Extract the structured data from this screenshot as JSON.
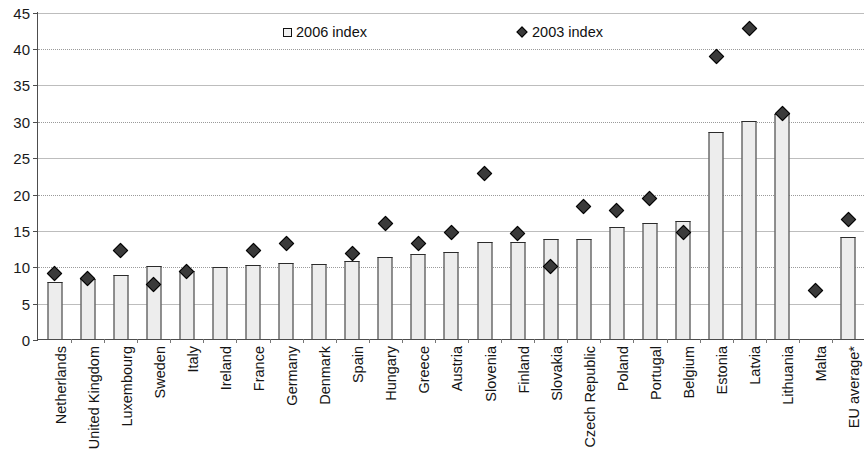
{
  "chart_data": {
    "type": "bar",
    "title": "",
    "subtitle": "",
    "xlabel": "",
    "ylabel": "",
    "ylim": [
      0,
      45
    ],
    "ytick_step": 5,
    "yticks": [
      0,
      5,
      10,
      15,
      20,
      25,
      30,
      35,
      40,
      45
    ],
    "grid": true,
    "legend_position": "top-center",
    "categories": [
      "Netherlands",
      "United Kingdom",
      "Luxembourg",
      "Sweden",
      "Italy",
      "Ireland",
      "France",
      "Germany",
      "Denmark",
      "Spain",
      "Hungary",
      "Greece",
      "Austria",
      "Slovenia",
      "Finland",
      "Slovakia",
      "Czech Republic",
      "Poland",
      "Portugal",
      "Belgium",
      "Estonia",
      "Latvia",
      "Lithuania",
      "Malta",
      "EU average*"
    ],
    "series": [
      {
        "name": "2006 index",
        "marker": "square",
        "render": "bar",
        "color": "#ededed",
        "edge_color": "#2b2b2b",
        "values": [
          7.9,
          8.3,
          8.8,
          10.0,
          9.4,
          9.9,
          10.2,
          10.4,
          10.3,
          10.7,
          11.3,
          11.7,
          12.0,
          13.3,
          13.3,
          13.7,
          13.7,
          15.4,
          16.0,
          16.2,
          28.4,
          30.0,
          31.0,
          null,
          14.0
        ]
      },
      {
        "name": "2003 index",
        "marker": "diamond",
        "render": "point",
        "color": "#3a3a3a",
        "edge_color": "#000000",
        "values": [
          9.1,
          8.5,
          12.3,
          7.6,
          9.4,
          null,
          12.3,
          13.2,
          null,
          11.9,
          16.0,
          13.2,
          14.8,
          22.9,
          14.6,
          10.1,
          18.3,
          17.8,
          19.5,
          14.8,
          39.0,
          42.8,
          31.2,
          6.8,
          16.6
        ]
      }
    ]
  },
  "legend": {
    "entries": [
      {
        "label": "2006 index",
        "marker": "square"
      },
      {
        "label": "2003 index",
        "marker": "diamond"
      }
    ]
  },
  "axis": {
    "y_tick_labels": [
      "45",
      "40",
      "35",
      "30",
      "25",
      "20",
      "15",
      "10",
      "5",
      "0"
    ]
  }
}
